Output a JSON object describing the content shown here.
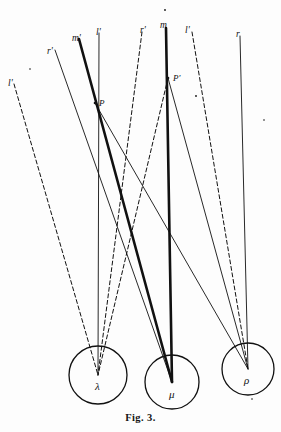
{
  "figure": {
    "caption": "Fig. 3.",
    "background_color": "#fdfdfd",
    "ink_color": "#111111",
    "width": 281,
    "height": 432
  },
  "chart_data": {
    "type": "diagram",
    "title": "Fig. 3.",
    "bodies": [
      {
        "id": "lambda",
        "label": "λ",
        "cx": 98,
        "cy": 375,
        "r": 29,
        "label_x": 95,
        "label_y": 381
      },
      {
        "id": "mu",
        "label": "μ",
        "cx": 172,
        "cy": 382,
        "r": 27,
        "label_x": 169,
        "label_y": 389
      },
      {
        "id": "rho",
        "label": "ρ",
        "cx": 248,
        "cy": 369,
        "r": 26,
        "label_x": 244,
        "label_y": 375
      }
    ],
    "vertices": [
      {
        "id": "P",
        "label": "P",
        "x": 95,
        "y": 103,
        "label_x": 99,
        "label_y": 99
      },
      {
        "id": "Pprime",
        "label": "P'",
        "x": 168,
        "y": 78,
        "label_x": 173,
        "label_y": 74
      }
    ],
    "ray_labels": [
      {
        "text": "r'",
        "x": 47,
        "y": 47
      },
      {
        "text": "m'",
        "x": 72,
        "y": 34
      },
      {
        "text": "l'",
        "x": 96,
        "y": 28
      },
      {
        "text": "r'",
        "x": 140,
        "y": 26
      },
      {
        "text": "m",
        "x": 160,
        "y": 21
      },
      {
        "text": "l'",
        "x": 185,
        "y": 26
      },
      {
        "text": "r",
        "x": 236,
        "y": 30
      },
      {
        "text": "l'",
        "x": 8,
        "y": 79
      }
    ],
    "rays": [
      {
        "name": "r-prime-left",
        "style": "thin",
        "x1": 55,
        "y1": 50,
        "x2": 172,
        "y2": 382
      },
      {
        "name": "m-prime-left",
        "style": "thick",
        "x1": 79,
        "y1": 39,
        "x2": 172,
        "y2": 382
      },
      {
        "name": "l-prime-left",
        "style": "thin",
        "x1": 99,
        "y1": 33,
        "x2": 98,
        "y2": 375
      },
      {
        "name": "r-prime-mid",
        "style": "dashed",
        "x1": 142,
        "y1": 32,
        "x2": 98,
        "y2": 375
      },
      {
        "name": "m-mid",
        "style": "thick",
        "x1": 166,
        "y1": 28,
        "x2": 172,
        "y2": 382
      },
      {
        "name": "l-prime-mid",
        "style": "dashed",
        "x1": 192,
        "y1": 32,
        "x2": 248,
        "y2": 369
      },
      {
        "name": "r-right",
        "style": "thin",
        "x1": 240,
        "y1": 36,
        "x2": 248,
        "y2": 369
      },
      {
        "name": "l-prime-far-left",
        "style": "dashed",
        "x1": 14,
        "y1": 84,
        "x2": 98,
        "y2": 375
      },
      {
        "name": "P-to-rho-thin",
        "style": "thin",
        "x1": 95,
        "y1": 103,
        "x2": 248,
        "y2": 369
      },
      {
        "name": "Pprime-to-lambda-dashed",
        "style": "dashed",
        "x1": 168,
        "y1": 78,
        "x2": 98,
        "y2": 375
      },
      {
        "name": "Pprime-to-rho-thin",
        "style": "thin",
        "x1": 168,
        "y1": 78,
        "x2": 248,
        "y2": 369
      }
    ],
    "stray_marks": [
      {
        "x": 165,
        "y": 10,
        "r": 0.9
      },
      {
        "x": 196,
        "y": 96,
        "r": 0.9
      },
      {
        "x": 30,
        "y": 69,
        "r": 0.8
      },
      {
        "x": 264,
        "y": 120,
        "r": 0.8
      },
      {
        "x": 252,
        "y": 399,
        "r": 0.8
      }
    ],
    "legend": {
      "visible": false
    },
    "grid": false
  }
}
